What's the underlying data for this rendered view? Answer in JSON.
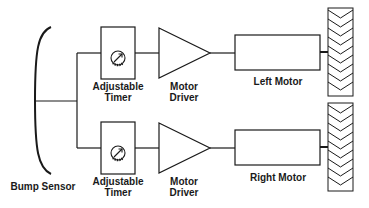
{
  "diagram": {
    "title": "",
    "nodes": {
      "bump_sensor": {
        "label": "Bump Sensor"
      },
      "timer_top": {
        "line1": "Adjustable",
        "line2": "Timer"
      },
      "timer_bottom": {
        "line1": "Adjustable",
        "line2": "Timer"
      },
      "driver_top": {
        "line1": "Motor",
        "line2": "Driver"
      },
      "driver_bottom": {
        "line1": "Motor",
        "line2": "Driver"
      },
      "left_motor": {
        "label": "Left Motor"
      },
      "right_motor": {
        "label": "Right Motor"
      }
    },
    "icons": {
      "timer_dial": "dial-knob-icon",
      "wheel": "tread-wheel-icon",
      "driver": "amplifier-triangle-icon"
    },
    "edges": [
      [
        "bump_sensor",
        "timer_top"
      ],
      [
        "bump_sensor",
        "timer_bottom"
      ],
      [
        "timer_top",
        "driver_top"
      ],
      [
        "timer_bottom",
        "driver_bottom"
      ],
      [
        "driver_top",
        "left_motor"
      ],
      [
        "driver_bottom",
        "right_motor"
      ],
      [
        "left_motor",
        "left_wheel"
      ],
      [
        "right_motor",
        "right_wheel"
      ]
    ],
    "colors": {
      "stroke": "#1a1a1a",
      "background": "#ffffff"
    }
  }
}
